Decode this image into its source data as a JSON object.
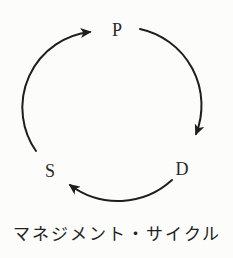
{
  "diagram": {
    "type": "cycle",
    "caption": "マネジメント・サイクル",
    "nodes": [
      {
        "id": "plan",
        "label": "P",
        "position": "top"
      },
      {
        "id": "do",
        "label": "D",
        "position": "bottom-right"
      },
      {
        "id": "see",
        "label": "S",
        "position": "bottom-left"
      }
    ],
    "arrows": [
      {
        "from": "P",
        "to": "D",
        "direction": "clockwise"
      },
      {
        "from": "D",
        "to": "S",
        "direction": "clockwise"
      },
      {
        "from": "S",
        "to": "P",
        "direction": "clockwise"
      }
    ],
    "colors": {
      "ink": "#1e1e1e",
      "background": "#fcfcfa"
    }
  }
}
